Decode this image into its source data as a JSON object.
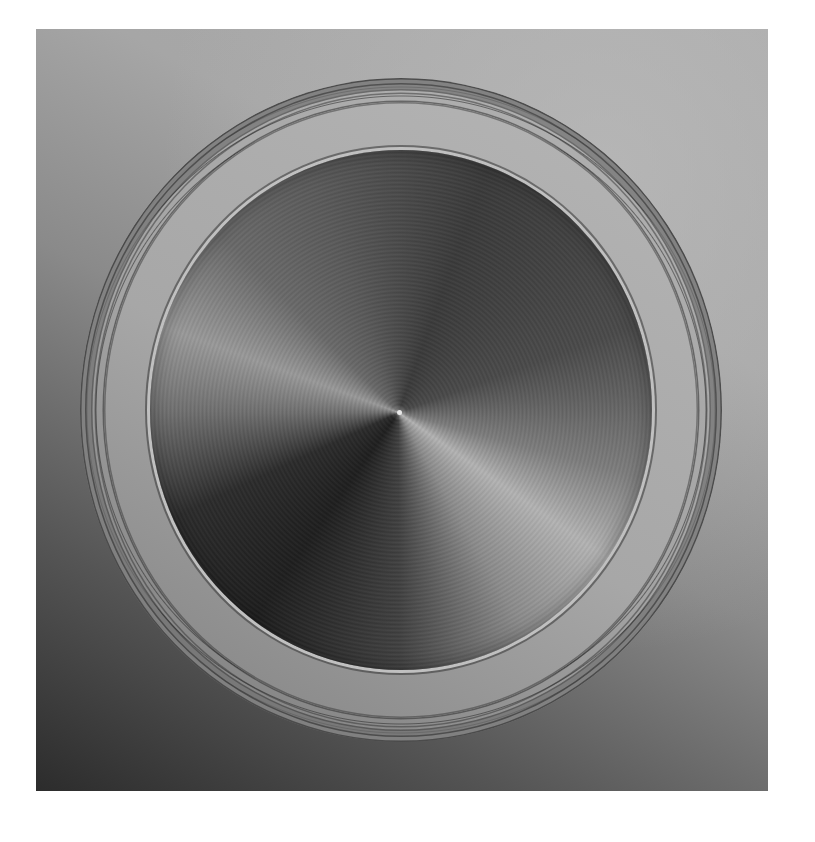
{
  "image": {
    "subject": "spun metal disc with textured concentric outer rings",
    "colors": {
      "page_background": "#ffffff",
      "background_light": "#ababab",
      "background_dark": "#2c2c2c",
      "ring_band": "#a7a7a7",
      "disc_dark": "#1e1e1e",
      "disc_highlight": "#b4b4b4"
    }
  }
}
